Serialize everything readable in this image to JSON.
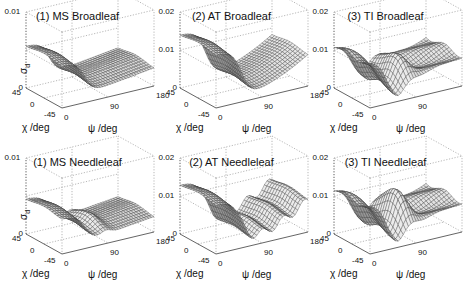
{
  "figure": {
    "panels": [
      {
        "title": "(1) MS Broadleaf",
        "zlabel": "σ",
        "zlabel_sub": "d",
        "zticks": [
          "0",
          "",
          "0.01"
        ],
        "zmax": 0.01,
        "kind": "MS",
        "leaf": "broad"
      },
      {
        "title": "(2) AT Broadleaf",
        "zlabel": "",
        "zlabel_sub": "",
        "zticks": [
          "0",
          "0.01",
          "0.02"
        ],
        "zmax": 0.02,
        "kind": "AT",
        "leaf": "broad"
      },
      {
        "title": "(3) TI Broadleaf",
        "zlabel": "",
        "zlabel_sub": "",
        "zticks": [
          "0",
          "0.01",
          "0.02"
        ],
        "zmax": 0.02,
        "kind": "TI",
        "leaf": "broad"
      },
      {
        "title": "(1) MS Needleleaf",
        "zlabel": "σ",
        "zlabel_sub": "d",
        "zticks": [
          "0",
          "",
          "0.01"
        ],
        "zmax": 0.01,
        "kind": "MS",
        "leaf": "needle"
      },
      {
        "title": "(2) AT Needleleaf",
        "zlabel": "",
        "zlabel_sub": "",
        "zticks": [
          "0",
          "0.01",
          "0.02"
        ],
        "zmax": 0.02,
        "kind": "AT",
        "leaf": "needle"
      },
      {
        "title": "(3) TI Needleleaf",
        "zlabel": "",
        "zlabel_sub": "",
        "zticks": [
          "0",
          "0.01",
          "0.02"
        ],
        "zmax": 0.02,
        "kind": "TI",
        "leaf": "needle"
      }
    ],
    "axes": {
      "x_label": "χ /deg",
      "x_ticks": [
        "45",
        "0",
        "-45"
      ],
      "y_label": "ψ /deg",
      "y_ticks": [
        "0",
        "90",
        "180"
      ]
    }
  },
  "chart_data": [
    {
      "type": "surface",
      "title": "(1) MS Broadleaf",
      "xlabel": "χ /deg",
      "ylabel": "ψ /deg",
      "zlabel": "σ_d",
      "xlim": [
        -45,
        45
      ],
      "ylim": [
        0,
        180
      ],
      "zlim": [
        0,
        0.01
      ],
      "xticks": [
        45,
        0,
        -45
      ],
      "yticks": [
        0,
        90,
        180
      ],
      "zticks": [
        0,
        0.01
      ],
      "description": "Plateau ~0.006 at ψ≈0 for all χ, dropping to valley near ψ≈60-90 (~0.0005), rising slightly to ~0.003 at ψ=180",
      "profile_psi": [
        0,
        30,
        60,
        90,
        120,
        150,
        180
      ],
      "profile_sigma": [
        0.006,
        0.0055,
        0.001,
        0.0008,
        0.0015,
        0.0025,
        0.003
      ]
    },
    {
      "type": "surface",
      "title": "(2) AT Broadleaf",
      "xlabel": "χ /deg",
      "ylabel": "ψ /deg",
      "zlim": [
        0,
        0.02
      ],
      "xticks": [
        45,
        0,
        -45
      ],
      "yticks": [
        0,
        90,
        180
      ],
      "zticks": [
        0,
        0.01,
        0.02
      ],
      "description": "Plateau ~0.015 at ψ≈0 dropping to valley ~0.001 near ψ≈60-90, rising to ~0.01 at ψ=180",
      "profile_psi": [
        0,
        30,
        60,
        90,
        120,
        150,
        180
      ],
      "profile_sigma": [
        0.015,
        0.013,
        0.002,
        0.0015,
        0.004,
        0.008,
        0.01
      ]
    },
    {
      "type": "surface",
      "title": "(3) TI Broadleaf",
      "xlabel": "χ /deg",
      "ylabel": "ψ /deg",
      "zlim": [
        0,
        0.02
      ],
      "xticks": [
        45,
        0,
        -45
      ],
      "yticks": [
        0,
        90,
        180
      ],
      "zticks": [
        0,
        0.01,
        0.02
      ],
      "description": "Undulating surface: ~0.012 at ψ≈0, dips to ~0.002, secondary bump ~0.007, dip, rising to ~0.008 at ψ=180; χ-dependent ripples",
      "profile_psi": [
        0,
        30,
        60,
        90,
        120,
        150,
        180
      ],
      "profile_sigma": [
        0.012,
        0.008,
        0.002,
        0.007,
        0.002,
        0.006,
        0.008
      ]
    },
    {
      "type": "surface",
      "title": "(1) MS Needleleaf",
      "xlabel": "χ /deg",
      "ylabel": "ψ /deg",
      "zlabel": "σ_d",
      "zlim": [
        0,
        0.01
      ],
      "xticks": [
        45,
        0,
        -45
      ],
      "yticks": [
        0,
        90,
        180
      ],
      "zticks": [
        0,
        0.01
      ],
      "description": "Plateau ~0.005 at ψ≈0, valley near ψ≈60 with small bump near ψ≈90 (~0.002), low ~0.0025 toward ψ=180",
      "profile_psi": [
        0,
        30,
        60,
        90,
        120,
        150,
        180
      ],
      "profile_sigma": [
        0.005,
        0.0045,
        0.0008,
        0.002,
        0.001,
        0.002,
        0.0025
      ]
    },
    {
      "type": "surface",
      "title": "(2) AT Needleleaf",
      "xlabel": "χ /deg",
      "ylabel": "ψ /deg",
      "zlim": [
        0,
        0.02
      ],
      "xticks": [
        45,
        0,
        -45
      ],
      "yticks": [
        0,
        90,
        180
      ],
      "zticks": [
        0,
        0.01,
        0.02
      ],
      "description": "Plateau ~0.014 at ψ≈0 dropping to ~0.002 valley with mild undulations, rising to ~0.009 at ψ=180",
      "profile_psi": [
        0,
        30,
        60,
        90,
        120,
        150,
        180
      ],
      "profile_sigma": [
        0.014,
        0.012,
        0.002,
        0.003,
        0.002,
        0.007,
        0.009
      ]
    },
    {
      "type": "surface",
      "title": "(3) TI Needleleaf",
      "xlabel": "χ /deg",
      "ylabel": "ψ /deg",
      "zlim": [
        0,
        0.02
      ],
      "xticks": [
        45,
        0,
        -45
      ],
      "yticks": [
        0,
        90,
        180
      ],
      "zticks": [
        0,
        0.01,
        0.02
      ],
      "description": "Strongly undulating: ~0.013 at ψ≈0, deep dip, peak ~0.009 near ψ≈90, dip, ~0.008 at ψ=180",
      "profile_psi": [
        0,
        30,
        60,
        90,
        120,
        150,
        180
      ],
      "profile_sigma": [
        0.013,
        0.008,
        0.001,
        0.009,
        0.001,
        0.006,
        0.008
      ]
    }
  ]
}
